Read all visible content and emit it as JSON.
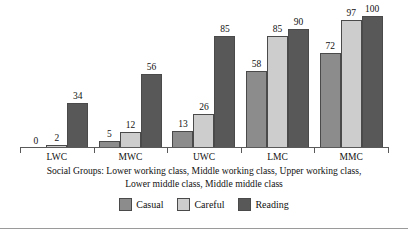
{
  "chart_data": {
    "type": "bar",
    "title": "",
    "subtitle": "",
    "xlabel": "Social Groups",
    "ylabel": "",
    "ylim": [
      0,
      100
    ],
    "grid": false,
    "legend_position": "bottom",
    "categories": [
      "LWC",
      "MWC",
      "UWC",
      "LMC",
      "MMC"
    ],
    "series": [
      {
        "name": "Casual",
        "color": "#8c8c8c",
        "values": [
          0,
          5,
          13,
          58,
          72
        ]
      },
      {
        "name": "Careful",
        "color": "#cdcdcd",
        "values": [
          2,
          12,
          26,
          85,
          97
        ]
      },
      {
        "name": "Reading",
        "color": "#585858",
        "values": [
          34,
          56,
          85,
          90,
          100
        ]
      }
    ],
    "caption_line1": "Social Groups: Lower working class, Middle working class, Upper working class,",
    "caption_line2": "Lower middle class, Middle middle class"
  },
  "legend": {
    "items": [
      {
        "label": "Casual"
      },
      {
        "label": "Careful"
      },
      {
        "label": "Reading"
      }
    ]
  }
}
